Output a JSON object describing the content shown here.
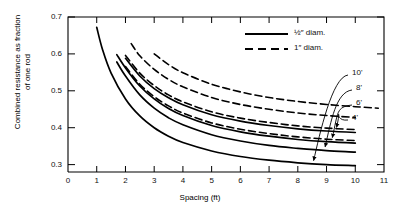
{
  "chart_data": {
    "type": "line",
    "title": "",
    "xlabel": "Spacing (ft)",
    "ylabel": "Combined resistance as fraction of one rod",
    "ylabel_line1": "Combined resistance as fraction",
    "ylabel_line2": "of one rod",
    "xlim": [
      0,
      11
    ],
    "ylim": [
      0.28,
      0.7
    ],
    "xticks": [
      0,
      1,
      2,
      3,
      4,
      5,
      6,
      7,
      8,
      9,
      10,
      11
    ],
    "yticks": [
      0.3,
      0.4,
      0.5,
      0.6,
      0.7
    ],
    "ytick_labels": [
      "0.3",
      "0.4",
      "0.5",
      "0.6",
      "0.7"
    ],
    "xtick_labels": [
      "0",
      "1",
      "2",
      "3",
      "4",
      "5",
      "6",
      "7",
      "8",
      "9",
      "10",
      "11"
    ],
    "grid": false,
    "legend_position": "top-right",
    "legend": [
      {
        "label": "½″  diam.",
        "style": "solid"
      },
      {
        "label": "1″  diam.",
        "style": "dashed"
      }
    ],
    "annotations": [
      {
        "text": "10'",
        "target_series": "half-10ft"
      },
      {
        "text": "8'",
        "target_series": "half-8ft"
      },
      {
        "text": "6'",
        "target_series": "half-6ft"
      },
      {
        "text": "4'",
        "target_series": "half-4ft"
      }
    ],
    "series": [
      {
        "name": "half-10ft",
        "rod_length": "10'",
        "diameter": "½″",
        "style": "solid",
        "x": [
          1.0,
          1.2,
          1.5,
          2.0,
          2.5,
          3.0,
          3.5,
          4.0,
          5.0,
          6.0,
          7.0,
          8.0,
          9.0,
          10.0
        ],
        "y": [
          0.672,
          0.612,
          0.548,
          0.478,
          0.432,
          0.4,
          0.377,
          0.36,
          0.337,
          0.322,
          0.312,
          0.305,
          0.3,
          0.297
        ]
      },
      {
        "name": "half-8ft",
        "rod_length": "8'",
        "diameter": "½″",
        "style": "solid",
        "x": [
          1.7,
          2.0,
          2.5,
          3.0,
          3.5,
          4.0,
          5.0,
          6.0,
          7.0,
          8.0,
          9.0,
          10.0
        ],
        "y": [
          0.578,
          0.54,
          0.489,
          0.453,
          0.427,
          0.408,
          0.381,
          0.364,
          0.352,
          0.344,
          0.338,
          0.334
        ]
      },
      {
        "name": "half-6ft",
        "rod_length": "6'",
        "diameter": "½″",
        "style": "solid",
        "x": [
          1.7,
          2.0,
          2.5,
          3.0,
          3.5,
          4.0,
          5.0,
          6.0,
          7.0,
          8.0,
          9.0,
          10.0
        ],
        "y": [
          0.598,
          0.562,
          0.513,
          0.478,
          0.452,
          0.433,
          0.406,
          0.389,
          0.377,
          0.368,
          0.362,
          0.358
        ]
      },
      {
        "name": "half-4ft",
        "rod_length": "4'",
        "diameter": "½″",
        "style": "solid",
        "x": [
          2.0,
          2.5,
          3.0,
          3.5,
          4.0,
          5.0,
          6.0,
          7.0,
          8.0,
          9.0,
          10.0
        ],
        "y": [
          0.588,
          0.54,
          0.506,
          0.481,
          0.462,
          0.435,
          0.418,
          0.406,
          0.397,
          0.391,
          0.387
        ]
      },
      {
        "name": "one-10ft",
        "rod_length": "10'",
        "diameter": "1″",
        "style": "dashed",
        "x": [
          2.0,
          2.5,
          3.0,
          3.5,
          4.0,
          5.0,
          6.0,
          7.0,
          8.0,
          9.0,
          10.0
        ],
        "y": [
          0.566,
          0.518,
          0.484,
          0.459,
          0.44,
          0.413,
          0.396,
          0.384,
          0.375,
          0.369,
          0.365
        ]
      },
      {
        "name": "one-8ft",
        "rod_length": "8'",
        "diameter": "1″",
        "style": "dashed",
        "x": [
          2.0,
          2.5,
          3.0,
          3.5,
          4.0,
          5.0,
          6.0,
          7.0,
          8.0,
          9.0,
          10.0
        ],
        "y": [
          0.596,
          0.548,
          0.514,
          0.489,
          0.47,
          0.443,
          0.426,
          0.414,
          0.405,
          0.399,
          0.395
        ]
      },
      {
        "name": "one-6ft",
        "rod_length": "6'",
        "diameter": "1″",
        "style": "dashed",
        "x": [
          2.2,
          2.5,
          3.0,
          3.5,
          4.0,
          5.0,
          6.0,
          7.0,
          8.0,
          9.0,
          10.0
        ],
        "y": [
          0.628,
          0.595,
          0.558,
          0.531,
          0.511,
          0.482,
          0.463,
          0.45,
          0.44,
          0.433,
          0.428
        ]
      },
      {
        "name": "one-4ft",
        "rod_length": "4'",
        "diameter": "1″",
        "style": "dashed",
        "x": [
          3.0,
          3.5,
          4.0,
          5.0,
          6.0,
          7.0,
          8.0,
          9.0,
          10.0,
          10.8
        ],
        "y": [
          0.6,
          0.571,
          0.549,
          0.518,
          0.497,
          0.482,
          0.471,
          0.463,
          0.457,
          0.453
        ]
      }
    ]
  }
}
